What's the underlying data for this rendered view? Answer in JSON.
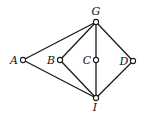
{
  "diagram": {
    "type": "graph",
    "nodes": [
      {
        "id": "G",
        "label": "G",
        "x": 96,
        "y": 22,
        "lx": 96,
        "ly": 15
      },
      {
        "id": "A",
        "label": "A",
        "x": 23,
        "y": 60,
        "lx": 14,
        "ly": 64
      },
      {
        "id": "B",
        "label": "B",
        "x": 60,
        "y": 60,
        "lx": 51,
        "ly": 64
      },
      {
        "id": "C",
        "label": "C",
        "x": 96,
        "y": 60,
        "lx": 87,
        "ly": 64
      },
      {
        "id": "D",
        "label": "D",
        "x": 133,
        "y": 61,
        "lx": 124,
        "ly": 65
      },
      {
        "id": "I",
        "label": "I",
        "x": 96,
        "y": 98,
        "lx": 95,
        "ly": 111
      }
    ],
    "edges": [
      [
        "G",
        "A"
      ],
      [
        "G",
        "B"
      ],
      [
        "G",
        "C"
      ],
      [
        "G",
        "D"
      ],
      [
        "A",
        "I"
      ],
      [
        "B",
        "I"
      ],
      [
        "C",
        "I"
      ],
      [
        "D",
        "I"
      ]
    ]
  }
}
